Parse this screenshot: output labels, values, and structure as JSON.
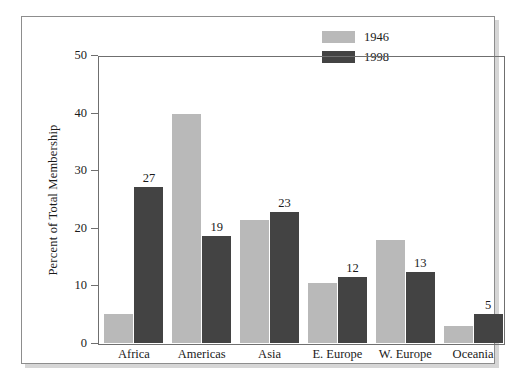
{
  "chart_data": {
    "type": "bar",
    "title": "",
    "subtitle": "",
    "xlabel": "",
    "ylabel": "Percent of Total Membership",
    "ylim": [
      0,
      50
    ],
    "ytick_labels": [
      "0",
      "10",
      "20",
      "30",
      "40",
      "50"
    ],
    "yticks": [
      0,
      10,
      20,
      30,
      40,
      50
    ],
    "grid": false,
    "legend_position": "top-right",
    "categories": [
      "Africa",
      "Americas",
      "Asia",
      "E. Europe",
      "W. Europe",
      "Oceania"
    ],
    "series": [
      {
        "name": "1946",
        "color": "#b9b9b9",
        "values": [
          5.0,
          39.8,
          21.3,
          10.5,
          17.8,
          3.0
        ],
        "data_labels": [
          "",
          "",
          "",
          "",
          "",
          ""
        ]
      },
      {
        "name": "1998",
        "color": "#434343",
        "values": [
          27,
          18.5,
          22.8,
          11.4,
          12.4,
          5.0
        ],
        "data_labels": [
          "27",
          "19",
          "23",
          "12",
          "13",
          "5"
        ]
      }
    ]
  },
  "legend": {
    "entries": [
      {
        "label": "1946",
        "swatch": "legend-swatch-1946"
      },
      {
        "label": "1998",
        "swatch": "legend-swatch-1998"
      }
    ]
  }
}
